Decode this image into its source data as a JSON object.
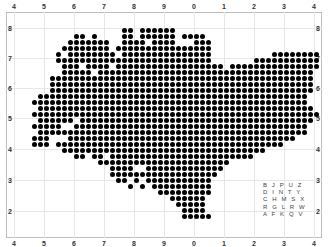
{
  "map": {
    "type": "dot-matrix grid map",
    "top_axis_labels": [
      "4",
      "5",
      "6",
      "7",
      "8",
      "9",
      "0",
      "1",
      "2",
      "3",
      "4"
    ],
    "bottom_axis_labels": [
      "4",
      "5",
      "6",
      "7",
      "8",
      "9",
      "0",
      "1",
      "2",
      "3",
      "4"
    ],
    "left_axis_labels": [
      "8",
      "7",
      "6",
      "5",
      "4",
      "3",
      "2"
    ],
    "right_axis_labels": [
      "8",
      "7",
      "6",
      "5",
      "4",
      "3",
      "2"
    ],
    "dot_color": "#000000",
    "grid_color": "#e6e6e6",
    "legend_rows": [
      "B J P U Z",
      "D I N T Y",
      "C H M S X",
      "R G L R W",
      "A F K Q V"
    ],
    "dot_rows": [
      "00000000000000000110111111000000000000000000000000",
      "00000000011010000110111111011110000000000000000000",
      "00000000111111100111101111000111000000000000000000",
      "00000001111111101111111111111111000000000000000000",
      "00000010111111110111111111111111000000000011111111",
      "00000011111111111111111111111111000000011111111111",
      "00000001110111101111111111111111110111111111111111",
      "00000001111101111111111111111111111111111111111110",
      "00000111111111111111111111111111111111111111111110",
      "00000111111111111111111111111111111111111111111110",
      "00000111111111111111111111111111111111111111111110",
      "00011111111111111111111111111111111111111111111100",
      "00111111111111111111111111111111111111111111111100",
      "00011111111111111111111111111111111111111111111110",
      "00111111111111111111111111111111111111111111111111",
      "00011111101111111111111111111111111111111111111110",
      "00111110011111111111111111111111111111111111111100",
      "00011111111111111111111111111111111111111111111100",
      "00111000111111111111111111111111111111111111110000",
      "00111011111111111111111111111111111111111111000000",
      "00000001111111111111111111111111111111111000000000",
      "00000000011011011111111111111111111111100000000000",
      "00000000000001111111111111111111111000000000000000",
      "00000000000000011110011111111111110000000000000000",
      "00000000000000011111111111111111100000000000000000",
      "00000000000000001101011111111111000000000000000000",
      "00000000000000000010101111111111000000000000000000",
      "00000000000000000000000111111111000000000000000000",
      "00000000000000000000000001111110000000000000000000",
      "00000000000000000000000000111110000000000000000000",
      "00000000000000000000000000011110000000000000000000",
      "00000000000000000000000000011111000000000000000000"
    ]
  }
}
